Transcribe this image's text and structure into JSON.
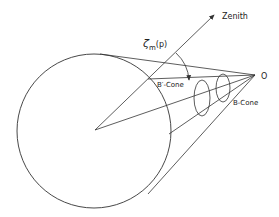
{
  "diagram": {
    "labels": {
      "zenith": "Zenith",
      "zeta": "ζ",
      "zeta_sub": "m",
      "zeta_arg": "(p)",
      "observer": "O",
      "b_prime_cone": "B′-Cone",
      "b_cone": "B-Cone"
    },
    "colors": {
      "stroke": "#333333",
      "background": "#ffffff"
    }
  }
}
